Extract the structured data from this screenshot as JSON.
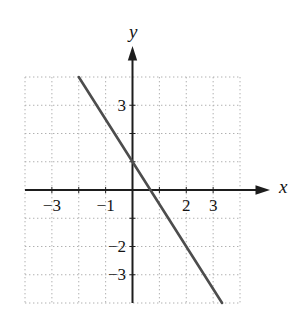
{
  "chart_data": {
    "type": "line",
    "title": "",
    "xlabel": "x",
    "ylabel": "y",
    "xlim": [
      -4,
      4
    ],
    "ylim": [
      -4,
      4
    ],
    "grid": "dotted",
    "legend": "none",
    "x_tick_labels": [
      {
        "value": -3,
        "label": "−3"
      },
      {
        "value": -1,
        "label": "−1"
      },
      {
        "value": 2,
        "label": "2"
      },
      {
        "value": 3,
        "label": "3"
      }
    ],
    "y_tick_labels": [
      {
        "value": 3,
        "label": "3"
      },
      {
        "value": -2,
        "label": "−2"
      },
      {
        "value": -3,
        "label": "−3"
      }
    ],
    "series": [
      {
        "name": "line",
        "equation": "y = -1.5x + 1",
        "slope": -1.5,
        "y_intercept": 1,
        "x_intercept": 0.6667,
        "points": [
          [
            -2,
            4
          ],
          [
            3.3333,
            -4
          ]
        ],
        "color": "#4d4d4d"
      }
    ],
    "colors": {
      "axis": "#1d1d1d",
      "grid": "#b0b0b0",
      "tick_text": "#141414",
      "background": "#ffffff"
    }
  }
}
